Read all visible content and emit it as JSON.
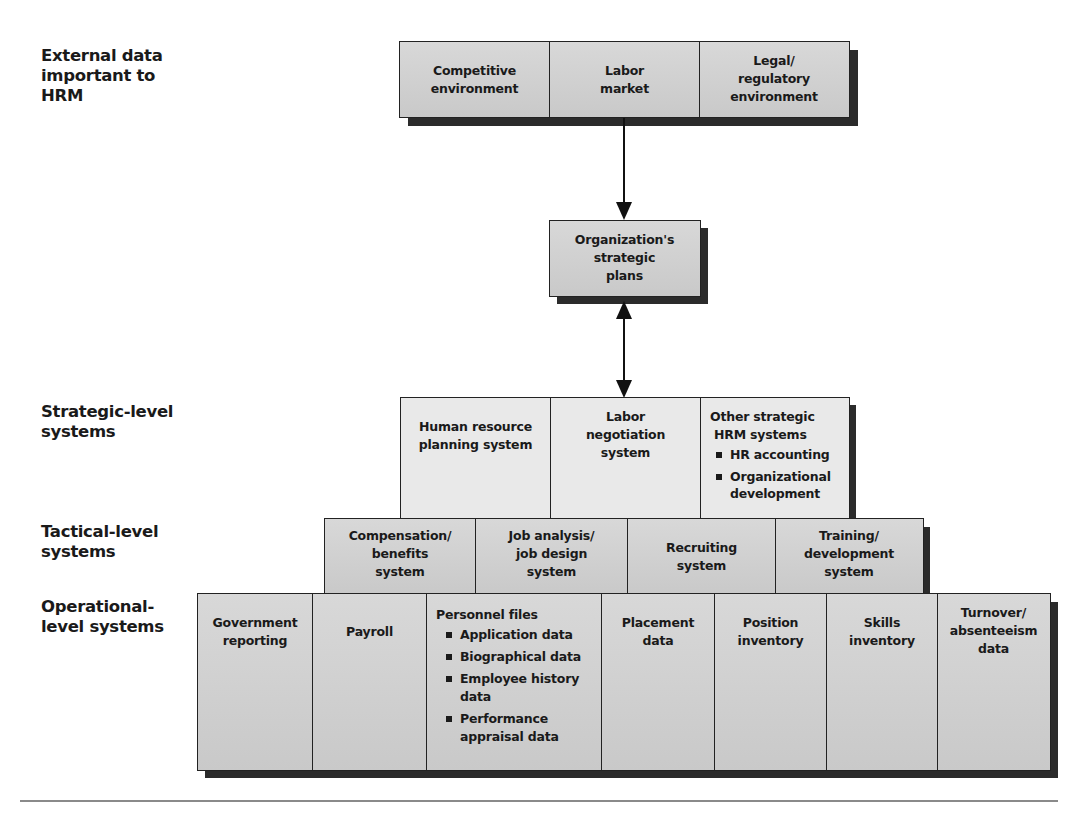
{
  "level_labels": {
    "external": "External data important to HRM",
    "strategic": "Strategic-level systems",
    "tactical": "Tactical-level systems",
    "operational": "Operational-level systems"
  },
  "level_labels_lines": {
    "external": [
      "External data",
      "important to",
      "HRM"
    ],
    "strategic": [
      "Strategic-level",
      "systems"
    ],
    "tactical": [
      "Tactical-level",
      "systems"
    ],
    "operational": [
      "Operational-",
      "level systems"
    ]
  },
  "external_data": [
    {
      "lines": [
        "Competitive",
        "environment"
      ]
    },
    {
      "lines": [
        "Labor",
        "market"
      ]
    },
    {
      "lines": [
        "Legal/",
        "regulatory",
        "environment"
      ]
    }
  ],
  "strategic_plans": {
    "lines": [
      "Organization's",
      "strategic",
      "plans"
    ]
  },
  "strategic_systems": [
    {
      "lines": [
        "Human resource",
        "planning system"
      ]
    },
    {
      "lines": [
        "Labor",
        "negotiation",
        "system"
      ]
    },
    {
      "lines": [
        "Other strategic",
        "HRM systems"
      ],
      "bullets": [
        "HR accounting",
        "Organizational development"
      ]
    }
  ],
  "tactical_systems": [
    {
      "lines": [
        "Compensation/",
        "benefits",
        "system"
      ]
    },
    {
      "lines": [
        "Job analysis/",
        "job design",
        "system"
      ]
    },
    {
      "lines": [
        "Recruiting",
        "system"
      ]
    },
    {
      "lines": [
        "Training/",
        "development",
        "system"
      ]
    }
  ],
  "operational_systems": [
    {
      "lines": [
        "Government",
        "reporting"
      ]
    },
    {
      "lines": [
        "Payroll"
      ]
    },
    {
      "lines": [
        "Personnel files"
      ],
      "bullets": [
        "Application data",
        "Biographical data",
        "Employee history data",
        "Performance appraisal data"
      ]
    },
    {
      "lines": [
        "Placement",
        "data"
      ]
    },
    {
      "lines": [
        "Position",
        "inventory"
      ]
    },
    {
      "lines": [
        "Skills",
        "inventory"
      ]
    },
    {
      "lines": [
        "Turnover/",
        "absenteeism",
        "data"
      ]
    }
  ],
  "colors": {
    "box_fill_gray": "#cfcfcf",
    "box_fill_light": "#e9e9e9",
    "shadow": "#2b2b2b",
    "border": "#222222",
    "rule": "#8a8a8a"
  }
}
